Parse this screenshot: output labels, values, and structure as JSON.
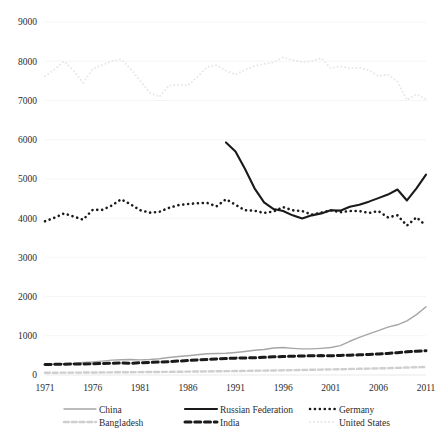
{
  "chart_data": {
    "type": "line",
    "title": "",
    "subtitle": "",
    "xlabel": "",
    "ylabel": "",
    "xlim": [
      1971,
      2011
    ],
    "ylim": [
      0,
      9000
    ],
    "y_ticks": [
      0,
      1000,
      2000,
      3000,
      4000,
      5000,
      6000,
      7000,
      8000,
      9000
    ],
    "x_ticks": [
      1971,
      1976,
      1981,
      1986,
      1991,
      1996,
      2001,
      2006,
      2011
    ],
    "grid": true,
    "legend_position": "bottom",
    "x": [
      1971,
      1972,
      1973,
      1974,
      1975,
      1976,
      1977,
      1978,
      1979,
      1980,
      1981,
      1982,
      1983,
      1984,
      1985,
      1986,
      1987,
      1988,
      1989,
      1990,
      1991,
      1992,
      1993,
      1994,
      1995,
      1996,
      1997,
      1998,
      1999,
      2000,
      2001,
      2002,
      2003,
      2004,
      2005,
      2006,
      2007,
      2008,
      2009,
      2010,
      2011
    ],
    "series": [
      {
        "name": "United States",
        "color": "#e8e8e8",
        "style": "dotted",
        "width": 2.0,
        "values": [
          7620,
          7790,
          8000,
          7760,
          7450,
          7800,
          7900,
          8000,
          8050,
          7800,
          7500,
          7200,
          7090,
          7380,
          7400,
          7380,
          7600,
          7850,
          7900,
          7760,
          7660,
          7780,
          7880,
          7930,
          7970,
          8100,
          8030,
          7980,
          8000,
          8080,
          7820,
          7870,
          7820,
          7830,
          7770,
          7620,
          7660,
          7480,
          7010,
          7160,
          7030
        ]
      },
      {
        "name": "Russian Federation",
        "color": "#1a1a1a",
        "style": "solid",
        "width": 2.1,
        "values": [
          null,
          null,
          null,
          null,
          null,
          null,
          null,
          null,
          null,
          null,
          null,
          null,
          null,
          null,
          null,
          null,
          null,
          null,
          null,
          5930,
          5700,
          5250,
          4760,
          4400,
          4230,
          4180,
          4070,
          3990,
          4070,
          4120,
          4200,
          4190,
          4290,
          4340,
          4420,
          4510,
          4600,
          4730,
          4450,
          4760,
          5110
        ]
      },
      {
        "name": "Germany",
        "color": "#1a1a1a",
        "style": "dotted",
        "width": 2.6,
        "values": [
          3920,
          4010,
          4120,
          4040,
          3960,
          4210,
          4210,
          4320,
          4480,
          4350,
          4200,
          4140,
          4160,
          4260,
          4330,
          4360,
          4380,
          4390,
          4300,
          4480,
          4340,
          4200,
          4190,
          4130,
          4170,
          4280,
          4200,
          4180,
          4090,
          4140,
          4200,
          4150,
          4180,
          4180,
          4130,
          4180,
          4020,
          4070,
          3810,
          4020,
          3810
        ]
      },
      {
        "name": "China",
        "color": "#a6a6a6",
        "style": "solid",
        "width": 1.4,
        "values": [
          260,
          270,
          285,
          290,
          320,
          330,
          355,
          380,
          390,
          395,
          385,
          395,
          415,
          445,
          470,
          490,
          515,
          540,
          550,
          555,
          575,
          600,
          630,
          650,
          690,
          700,
          680,
          665,
          665,
          680,
          700,
          750,
          860,
          960,
          1050,
          1130,
          1220,
          1280,
          1380,
          1540,
          1740
        ]
      },
      {
        "name": "India",
        "color": "#1a1a1a",
        "style": "dashed",
        "width": 3.0,
        "values": [
          268,
          272,
          276,
          278,
          280,
          285,
          292,
          298,
          305,
          300,
          312,
          320,
          330,
          340,
          355,
          370,
          385,
          395,
          410,
          420,
          430,
          435,
          440,
          450,
          465,
          470,
          480,
          485,
          490,
          495,
          490,
          500,
          505,
          515,
          525,
          535,
          550,
          570,
          590,
          605,
          620
        ]
      },
      {
        "name": "Bangladesh",
        "color": "#cfcfcf",
        "style": "dashed",
        "width": 2.4,
        "values": [
          58,
          59,
          60,
          61,
          62,
          64,
          66,
          68,
          70,
          72,
          74,
          76,
          78,
          80,
          83,
          86,
          89,
          92,
          95,
          98,
          101,
          104,
          108,
          112,
          116,
          120,
          124,
          128,
          133,
          138,
          143,
          148,
          153,
          158,
          163,
          169,
          175,
          182,
          190,
          198,
          205
        ]
      }
    ]
  },
  "legend": {
    "entries": [
      {
        "label": "China",
        "key": "China"
      },
      {
        "label": "Russian Federation",
        "key": "Russian Federation"
      },
      {
        "label": "Germany",
        "key": "Germany"
      },
      {
        "label": "Bangladesh",
        "key": "Bangladesh"
      },
      {
        "label": "India",
        "key": "India"
      },
      {
        "label": "United States",
        "key": "United States"
      }
    ]
  }
}
